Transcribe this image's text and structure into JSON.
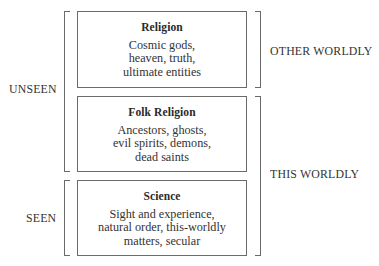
{
  "diagram": {
    "boxes": [
      {
        "title": "Religion",
        "lines": [
          "Cosmic gods,",
          "heaven, truth,",
          "ultimate entities"
        ]
      },
      {
        "title": "Folk Religion",
        "lines": [
          "Ancestors, ghosts,",
          "evil spirits, demons,",
          "dead saints"
        ]
      },
      {
        "title": "Science",
        "lines": [
          "Sight and experience,",
          "natural order, this-worldly",
          "matters, secular"
        ]
      }
    ],
    "left_labels": {
      "unseen": "UNSEEN",
      "seen": "SEEN"
    },
    "right_labels": {
      "other_worldly": "OTHER WORLDLY",
      "this_worldly": "THIS WORLDLY"
    },
    "colors": {
      "line": "#6a6a6a",
      "text": "#2a2a2a",
      "background": "#ffffff"
    }
  }
}
